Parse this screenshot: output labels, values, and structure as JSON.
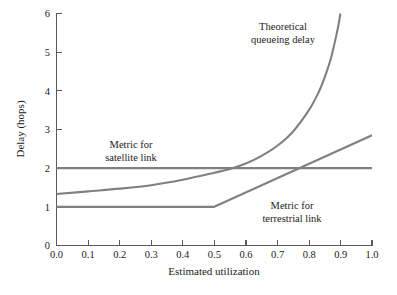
{
  "chart_data": {
    "type": "line",
    "title": "",
    "xlabel": "Estimated utilization",
    "ylabel": "Delay (hops)",
    "xlim": [
      0.0,
      1.0
    ],
    "ylim": [
      0,
      6
    ],
    "grid": false,
    "legend": "none (inline annotations)",
    "xticks": [
      "0.0",
      "0.1",
      "0.2",
      "0.3",
      "0.4",
      "0.5",
      "0.6",
      "0.7",
      "0.8",
      "0.9",
      "1.0"
    ],
    "xtick_values": [
      0.0,
      0.1,
      0.2,
      0.3,
      0.4,
      0.5,
      0.6,
      0.7,
      0.8,
      0.9,
      1.0
    ],
    "yticks": [
      "0",
      "1",
      "2",
      "3",
      "4",
      "5",
      "6"
    ],
    "ytick_values": [
      0,
      1,
      2,
      3,
      4,
      5,
      6
    ],
    "line_color": "#808080",
    "axis_color": "#5a5a5a",
    "background": "#ffffff",
    "series": [
      {
        "name": "Theoretical queueing delay",
        "annotation": "Theoretical\nqueueing delay",
        "annotation_line1": "Theoretical",
        "annotation_line2": "queueing delay",
        "x": [
          0.0,
          0.1,
          0.2,
          0.3,
          0.4,
          0.5,
          0.55,
          0.6,
          0.65,
          0.7,
          0.75,
          0.8,
          0.83,
          0.85,
          0.87,
          0.89,
          0.9
        ],
        "values": [
          1.33,
          1.4,
          1.47,
          1.56,
          1.7,
          1.88,
          1.98,
          2.12,
          2.32,
          2.58,
          2.95,
          3.5,
          3.95,
          4.35,
          4.85,
          5.55,
          6.0
        ]
      },
      {
        "name": "Metric for satellite link",
        "annotation": "Metric for\nsatellite link",
        "annotation_line1": "Metric for",
        "annotation_line2": "satellite link",
        "x": [
          0.0,
          1.0
        ],
        "values": [
          2.0,
          2.0
        ]
      },
      {
        "name": "Metric for terrestrial link",
        "annotation": "Metric for\nterrestrial link",
        "annotation_line1": "Metric for",
        "annotation_line2": "terrestrial link",
        "x": [
          0.0,
          0.5,
          1.0
        ],
        "values": [
          1.0,
          1.0,
          2.85
        ]
      }
    ],
    "annotations": [
      {
        "text_line1": "Theoretical",
        "text_line2": "queueing delay",
        "x": 0.72,
        "y": 5.55
      },
      {
        "text_line1": "Metric for",
        "text_line2": "satellite link",
        "x": 0.235,
        "y": 2.62
      },
      {
        "text_line1": "Metric for",
        "text_line2": "terrestrial link",
        "x": 0.745,
        "y": 1.02
      }
    ],
    "crossings": {
      "queueing_crosses_satellite_metric": 0.57,
      "terrestrial_metric_crosses_satellite_metric": 0.74,
      "terrestrial_knee": 0.5
    }
  }
}
